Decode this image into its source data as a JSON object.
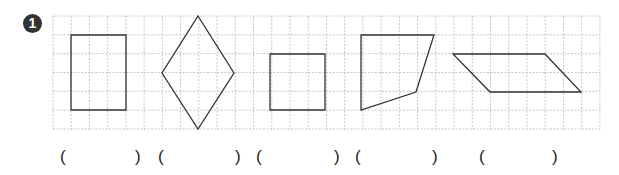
{
  "problem": {
    "number": "1",
    "grid": {
      "left": 53,
      "top": 16,
      "cols": 30,
      "rows": 6,
      "cell_w": 18.23,
      "cell_h": 18.83,
      "line_color": "#b8b8b8"
    },
    "shapes": [
      {
        "name": "rectangle",
        "points": "71,35 126,35 126,110 71,110"
      },
      {
        "name": "rhombus",
        "points": "198,16 234,73 198,129 162,73"
      },
      {
        "name": "square",
        "points": "270,54 325,54 325,110 270,110"
      },
      {
        "name": "quadrilateral",
        "points": "361,35 434,35 416,92 361,110"
      },
      {
        "name": "parallelogram",
        "points": "453,54 545,54 581,92 490,92"
      }
    ],
    "answers": [
      {
        "open": "(",
        "close": ")",
        "open_x": 60,
        "close_x": 135
      },
      {
        "open": "(",
        "close": ")",
        "open_x": 158,
        "close_x": 235
      },
      {
        "open": "(",
        "close": ")",
        "open_x": 256,
        "close_x": 334
      },
      {
        "open": "(",
        "close": ")",
        "open_x": 355,
        "close_x": 432
      },
      {
        "open": "(",
        "close": ")",
        "open_x": 479,
        "close_x": 552
      }
    ]
  }
}
